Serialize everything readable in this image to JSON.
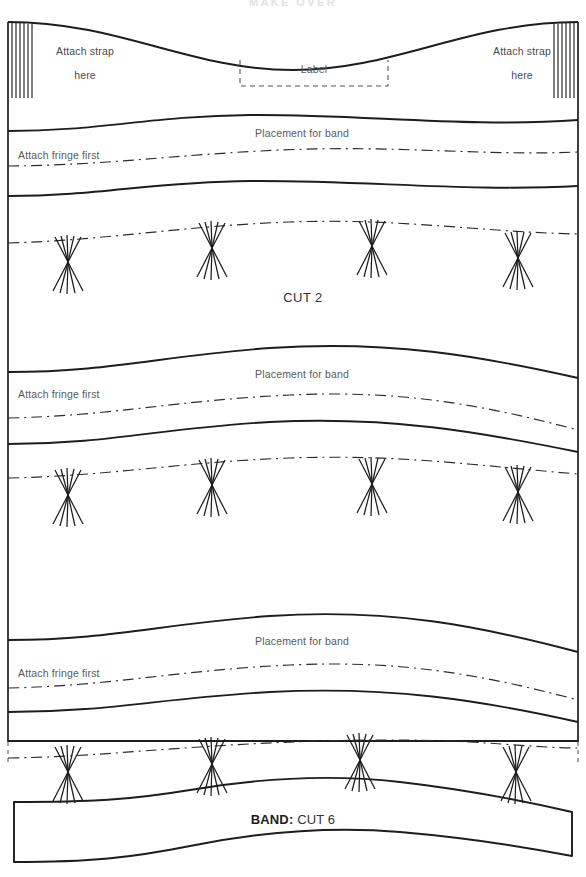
{
  "document": {
    "type": "sewing-pattern-sheet",
    "header_text": "MAKE OVER",
    "width_px": 586,
    "height_px": 877
  },
  "colors": {
    "ink": "#1d1d1d",
    "line": "#2b2b2b",
    "text": "#4a4a4a",
    "header": "#e2e2e4",
    "paper": "#ffffff"
  },
  "labels": {
    "attach_strap_line1": "Attach strap",
    "attach_strap_line2": "here",
    "label_box": "Label",
    "placement_for_band": "Placement for band",
    "attach_fringe_first": "Attach fringe first",
    "cut_2": "CUT 2",
    "band_name": "BAND:",
    "band_cut": " CUT 6"
  },
  "pieces": [
    {
      "name": "main-panel",
      "instruction": "CUT 2",
      "notes": [
        "Attach strap here",
        "Label",
        "Placement for band",
        "Attach fringe first"
      ]
    },
    {
      "name": "band-piece",
      "instruction": "CUT 6",
      "notes": [
        "BAND: CUT 6"
      ]
    }
  ],
  "markings": {
    "strap_hatching_left": {
      "lines": 6,
      "x_start": 8,
      "x_end": 30,
      "y_top": 24,
      "y_bottom": 98
    },
    "strap_hatching_right": {
      "lines": 6,
      "x_start": 556,
      "x_end": 578,
      "y_top": 24,
      "y_bottom": 98
    },
    "label_box": {
      "x": 240,
      "y": 58,
      "width": 148,
      "height": 28,
      "style": "dashed"
    },
    "fringe_rows": [
      {
        "row": 1,
        "y": 238,
        "tassels_x": [
          68,
          212,
          372,
          518
        ]
      },
      {
        "row": 2,
        "y": 478,
        "tassels_x": [
          68,
          212,
          372,
          518
        ]
      },
      {
        "row": 3,
        "y": 752,
        "tassels_x": [
          68,
          212,
          360,
          516
        ]
      }
    ],
    "band_placement_lines": 3,
    "fringe_lines": 3,
    "line_styles": {
      "cut_line": "solid",
      "placement_line": "dash-dot",
      "label_box_line": "dashed"
    }
  }
}
